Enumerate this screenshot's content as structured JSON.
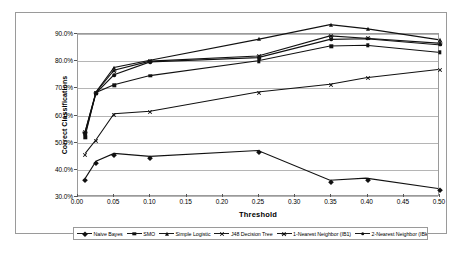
{
  "chart_data": {
    "type": "line",
    "title": "",
    "xlabel": "Threshold",
    "ylabel": "Correct Classifications",
    "xlim": [
      0.0,
      0.5
    ],
    "ylim": [
      30.0,
      90.0
    ],
    "x_ticks": [
      "0.00",
      "0.05",
      "0.10",
      "0.15",
      "0.20",
      "0.25",
      "0.30",
      "0.35",
      "0.40",
      "0.45",
      "0.50"
    ],
    "x_tick_values": [
      0.0,
      0.05,
      0.1,
      0.15,
      0.2,
      0.25,
      0.3,
      0.35,
      0.4,
      0.45,
      0.5
    ],
    "y_ticks": [
      "30.0%",
      "40.0%",
      "50.0%",
      "60.0%",
      "70.0%",
      "80.0%",
      "90.0%"
    ],
    "y_tick_values": [
      30,
      40,
      50,
      60,
      70,
      80,
      90
    ],
    "grid": "horizontal",
    "legend_position": "bottom",
    "x": [
      0.01,
      0.025,
      0.05,
      0.1,
      0.25,
      0.35,
      0.4,
      0.5
    ],
    "series": [
      {
        "name": "Naive Bayes",
        "marker": "diamond",
        "color": "#111111",
        "values": [
          36.2,
          42.6,
          45.5,
          44.4,
          46.6,
          35.5,
          36.3,
          32.4
        ]
      },
      {
        "name": "SMO",
        "marker": "square",
        "color": "#111111",
        "values": [
          52.0,
          68.2,
          71.1,
          74.5,
          80.0,
          85.5,
          85.8,
          83.2
        ]
      },
      {
        "name": "Simple Logistic",
        "marker": "triangle",
        "color": "#111111",
        "values": [
          53.5,
          68.4,
          77.5,
          80.2,
          88.0,
          93.5,
          92.0,
          87.9
        ]
      },
      {
        "name": "J48 Decision Tree",
        "marker": "x",
        "color": "#111111",
        "values": [
          45.5,
          50.6,
          60.3,
          61.2,
          68.4,
          71.3,
          73.7,
          76.8
        ]
      },
      {
        "name": "1-Nearest Neighbor (IB1)",
        "marker": "star",
        "color": "#111111",
        "values": [
          53.8,
          68.3,
          76.5,
          79.9,
          81.8,
          89.3,
          88.4,
          86.6
        ]
      },
      {
        "name": "2-Nearest Neighbor (IBk)",
        "marker": "circle",
        "color": "#111111",
        "values": [
          53.0,
          68.0,
          74.8,
          79.6,
          81.2,
          88.0,
          88.2,
          86.0
        ]
      }
    ]
  },
  "axis": {
    "y_title": "Correct Classifications",
    "x_title": "Threshold"
  }
}
